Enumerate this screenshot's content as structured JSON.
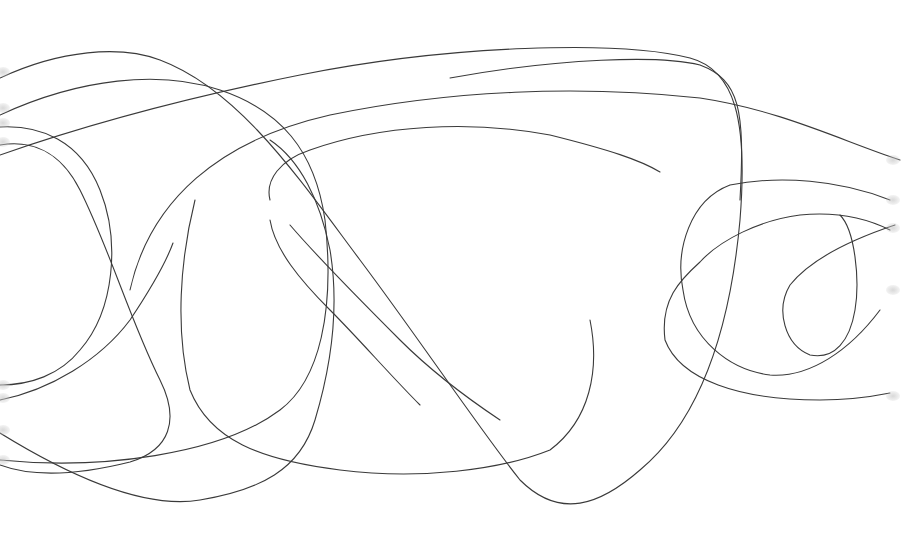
{
  "image": {
    "description": "Abstract continuous line drawing of overlapping looping curves on a white background",
    "background": "#ffffff",
    "stroke_color": "#3a3a3a",
    "width": 902,
    "height": 536
  },
  "paths": [
    "M0,78 C60,50 120,45 160,60 C240,90 300,180 360,260 C420,340 480,430 520,480 C560,520 600,505 640,470 C700,420 730,330 740,220 C748,120 735,70 690,58 C620,40 450,45 300,75 C200,95 100,120 0,155",
    "M0,115 C80,78 160,70 220,90 C280,110 315,150 325,220 C335,310 320,380 280,410 C220,455 100,470 0,460",
    "M0,127 C40,125 80,140 100,190 C120,240 115,310 80,350 C60,375 30,385 0,385",
    "M0,145 C30,140 60,150 80,190 C110,250 130,320 160,380 C180,420 170,450 130,462 C90,472 40,480 0,465",
    "M0,400 C50,390 100,360 130,320 C150,290 165,265 173,243",
    "M0,433 C60,470 140,510 200,500 C260,490 300,470 315,420 C330,370 340,310 330,250 C320,200 300,160 270,140",
    "M450,78 C560,58 660,55 700,65 C740,80 745,110 740,200",
    "M130,290 C150,200 220,140 330,115 C450,90 580,85 700,98 C780,110 840,140 900,160",
    "M270,200 C265,180 280,160 310,150 C380,125 470,120 550,135 C610,150 640,160 660,172",
    "M290,225 C320,260 360,300 400,340 C430,370 470,400 500,420",
    "M195,200 C180,260 175,330 190,390 C210,440 260,460 340,470 C420,480 500,470 550,450 C590,420 600,370 590,320",
    "M890,200 C840,180 780,175 730,185 C690,200 675,250 683,290 C690,340 730,370 770,375 C810,378 850,350 880,310",
    "M890,230 C860,215 830,212 800,215 C760,220 720,240 700,262 C680,280 660,300 665,340 C680,380 740,400 820,400 C850,400 875,396 890,393",
    "M895,225 C850,240 810,260 790,285 C775,310 785,345 810,355 C835,360 850,340 855,310 C860,280 855,230 840,215",
    "M270,220 C275,250 300,280 330,310 C360,340 390,375 420,405"
  ],
  "edge_marks": [
    {
      "x": 0,
      "y": 72
    },
    {
      "x": 0,
      "y": 108
    },
    {
      "x": 0,
      "y": 123
    },
    {
      "x": 0,
      "y": 142
    },
    {
      "x": 0,
      "y": 385
    },
    {
      "x": 0,
      "y": 398
    },
    {
      "x": 0,
      "y": 430
    },
    {
      "x": 0,
      "y": 460
    },
    {
      "x": 890,
      "y": 160
    },
    {
      "x": 890,
      "y": 200
    },
    {
      "x": 890,
      "y": 228
    },
    {
      "x": 890,
      "y": 290
    },
    {
      "x": 890,
      "y": 396
    }
  ]
}
